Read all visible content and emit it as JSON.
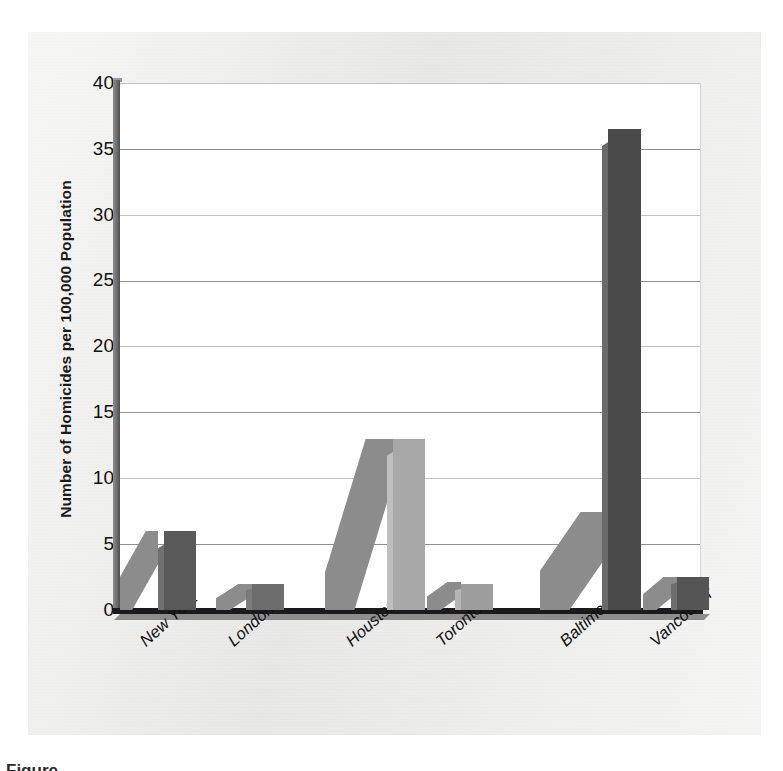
{
  "chart_data": {
    "type": "bar",
    "title": "",
    "subtitle": "",
    "xlabel": "",
    "ylabel": "Number of Homicides per 100,000 Population",
    "categories": [
      "New York",
      "London",
      "Houston",
      "Toronto",
      "Baltimore",
      "Vancouver"
    ],
    "values": [
      6,
      2,
      13,
      2,
      36.5,
      2.5
    ],
    "series": [
      {
        "name": "Homicides per 100,000",
        "values": [
          6,
          2,
          13,
          2,
          36.5,
          2.5
        ]
      }
    ],
    "ylim": [
      0,
      40
    ],
    "yticks": [
      0,
      5,
      10,
      15,
      20,
      25,
      30,
      35,
      40
    ],
    "ytick_labels": [
      "0",
      "5",
      "10",
      "15",
      "20",
      "25",
      "30",
      "35",
      "40"
    ],
    "grid": true,
    "grid_axis": "y",
    "legend": false,
    "legend_position": "none",
    "bar_style": "3d-extruded-with-dropshadow",
    "x_tick_rotation": -42,
    "bar_colors": [
      "#595959",
      "#6d6d6d",
      "#a8a8a8",
      "#9d9d9d",
      "#4a4a4a",
      "#555555"
    ],
    "annotations": []
  },
  "axis": {
    "y_title": "Number of Homicides per 100,000 Population",
    "ticks": [
      "40",
      "35",
      "30",
      "25",
      "20",
      "15",
      "10",
      "5",
      "0"
    ]
  },
  "xlabels": [
    {
      "text": "New York"
    },
    {
      "text": "London"
    },
    {
      "text": "Houston"
    },
    {
      "text": "Toronto"
    },
    {
      "text": "Baltimore"
    },
    {
      "text": "Vancouver"
    }
  ],
  "caption": {
    "sliver": "Figure"
  },
  "colors": {
    "figure_background": "#ececeb",
    "plot_background": "#ffffff",
    "axis_dark": "#1b1b1b",
    "gridline": "#8f8f8f",
    "bar_dark": "#595959",
    "bar_light": "#a8a8a8",
    "shadow": "#8c8c8c"
  }
}
